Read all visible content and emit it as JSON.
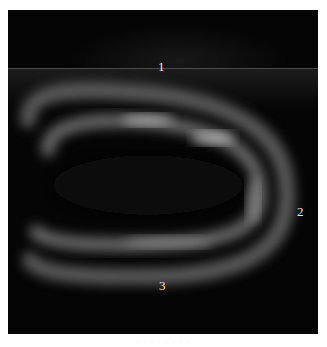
{
  "figure": {
    "labels": [
      {
        "id": "1",
        "text": "1"
      },
      {
        "id": "2",
        "text": "2"
      },
      {
        "id": "3",
        "text": "3"
      }
    ],
    "caption": "· · ·  ·  ·  ·  · ·"
  }
}
